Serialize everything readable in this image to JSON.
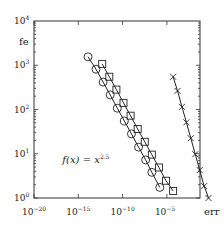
{
  "chart_data": {
    "type": "line",
    "title": "",
    "xlabel": "err",
    "ylabel": "fe",
    "xscale": "log",
    "yscale": "log",
    "xlim_log10": [
      -20,
      -1.26
    ],
    "ylim_log10": [
      0,
      4
    ],
    "x_ticks": [
      {
        "log": -20,
        "label": "10",
        "exp": "−20"
      },
      {
        "log": -15,
        "label": "10",
        "exp": "−15"
      },
      {
        "log": -10,
        "label": "10",
        "exp": "−10"
      },
      {
        "log": -5,
        "label": "10",
        "exp": "−5"
      }
    ],
    "y_ticks": [
      {
        "log": 0,
        "label": "10",
        "exp": "0"
      },
      {
        "log": 1,
        "label": "10",
        "exp": "1"
      },
      {
        "log": 2,
        "label": "10",
        "exp": "2"
      },
      {
        "log": 3,
        "label": "10",
        "exp": "3"
      },
      {
        "log": 4,
        "label": "10",
        "exp": "4"
      }
    ],
    "grid": false,
    "legend": "none",
    "annotation": {
      "text": "f(x) = x",
      "exp": "2.5",
      "x_log": -16.8,
      "y_log": 0.78
    },
    "series": [
      {
        "name": "circles",
        "marker": "circle",
        "points_log10": [
          [
            -13.9,
            3.19
          ],
          [
            -13.0,
            2.91
          ],
          [
            -12.2,
            2.62
          ],
          [
            -11.4,
            2.33
          ],
          [
            -10.6,
            2.03
          ],
          [
            -9.8,
            1.74
          ],
          [
            -9.0,
            1.45
          ],
          [
            -8.2,
            1.15
          ],
          [
            -7.4,
            0.86
          ],
          [
            -6.7,
            0.58
          ],
          [
            -5.8,
            0.24
          ]
        ]
      },
      {
        "name": "squares",
        "marker": "square",
        "points_log10": [
          [
            -12.3,
            3.03
          ],
          [
            -11.5,
            2.74
          ],
          [
            -10.7,
            2.45
          ],
          [
            -9.9,
            2.15
          ],
          [
            -9.1,
            1.86
          ],
          [
            -8.3,
            1.56
          ],
          [
            -7.5,
            1.27
          ],
          [
            -6.7,
            0.98
          ],
          [
            -5.9,
            0.69
          ],
          [
            -5.1,
            0.39
          ],
          [
            -4.3,
            0.16
          ]
        ]
      },
      {
        "name": "crosses",
        "marker": "x",
        "points_log10": [
          [
            -4.3,
            2.74
          ],
          [
            -3.8,
            2.42
          ],
          [
            -3.3,
            2.06
          ],
          [
            -2.8,
            1.71
          ],
          [
            -2.3,
            1.35
          ],
          [
            -1.8,
            0.99
          ],
          [
            -1.3,
            0.63
          ],
          [
            -0.8,
            0.27
          ],
          [
            -0.3,
            0.0
          ]
        ]
      }
    ]
  },
  "plot": {
    "frame": {
      "left": 34,
      "top": 21,
      "right": 200,
      "bottom": 198
    },
    "x_decade_px": 8.86,
    "y_decade_px": 44.25
  }
}
